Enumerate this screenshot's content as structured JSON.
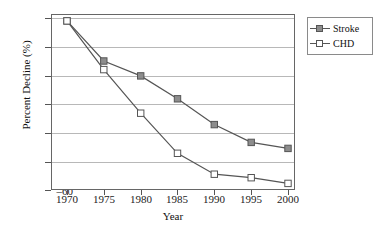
{
  "chart_data": {
    "type": "line",
    "title": "",
    "xlabel": "Year",
    "ylabel": "Percent Decline (%)",
    "x": [
      1970,
      1975,
      1980,
      1985,
      1990,
      1995,
      2000
    ],
    "xticklabels": [
      "1970",
      "1975",
      "1980",
      "1985",
      "1990",
      "1995",
      "2000"
    ],
    "yticklabels": [
      "0",
      "–10",
      "–20",
      "–30",
      "–40",
      "–50",
      "–60"
    ],
    "yticks": [
      0,
      -10,
      -20,
      -30,
      -40,
      -50,
      -60
    ],
    "xlim": [
      1968,
      2002
    ],
    "ylim": [
      -60,
      0
    ],
    "grid": "horizontal",
    "legend_position": "right-outside",
    "series": [
      {
        "name": "Stroke",
        "marker": "filled-square",
        "marker_color": "#8d8d8d",
        "line_color": "#555555",
        "values": [
          -1.0,
          -15.0,
          -20.2,
          -28.2,
          -37.2,
          -43.4,
          -45.5
        ]
      },
      {
        "name": "CHD",
        "marker": "hollow-square",
        "marker_color": "#ffffff",
        "line_color": "#555555",
        "values": [
          -1.0,
          -18.0,
          -33.2,
          -47.2,
          -54.5,
          -55.7,
          -57.7
        ]
      }
    ]
  },
  "legend": {
    "items": [
      {
        "label": "Stroke"
      },
      {
        "label": "CHD"
      }
    ]
  },
  "colors": {
    "background": "#ffffff",
    "gridline": "#b8b8b8",
    "frame": "#666666",
    "text": "#111111",
    "stroke_marker_fill": "#8d8d8d",
    "chd_marker_fill": "#ffffff",
    "line": "#555555"
  }
}
